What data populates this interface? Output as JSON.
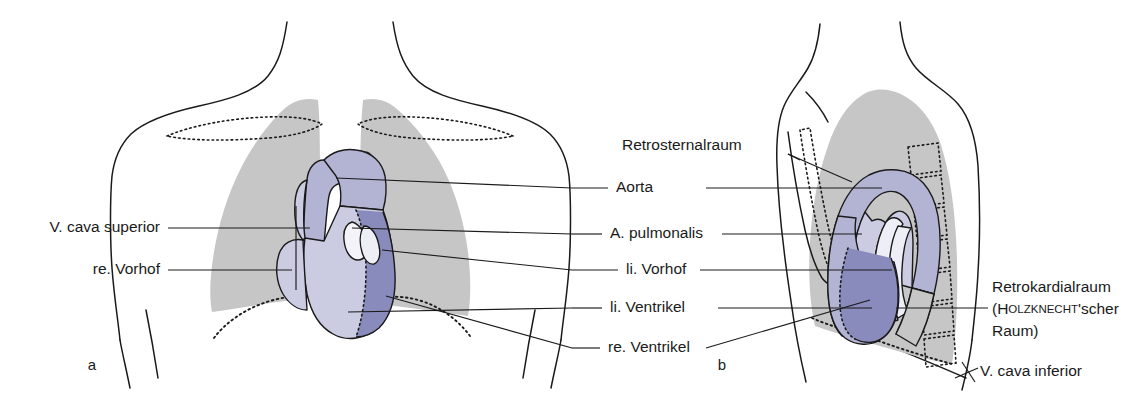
{
  "figure": {
    "panels": [
      {
        "id": "a",
        "letter": "a",
        "view": "frontal (p.-a.) Projektion"
      },
      {
        "id": "b",
        "letter": "b",
        "view": "seitliche Projektion"
      }
    ]
  },
  "labels": {
    "left": [
      {
        "id": "v-cava-superior",
        "text": "V. cava superior"
      },
      {
        "id": "re-vorhof",
        "text": "re. Vorhof"
      }
    ],
    "center": [
      {
        "id": "retrosternalraum",
        "text": "Retrosternalraum"
      },
      {
        "id": "aorta",
        "text": "Aorta"
      },
      {
        "id": "a-pulmonalis",
        "text": "A. pulmonalis"
      },
      {
        "id": "li-vorhof",
        "text": "li. Vorhof"
      },
      {
        "id": "li-ventrikel",
        "text": "li. Ventrikel"
      },
      {
        "id": "re-ventrikel",
        "text": "re. Ventrikel"
      }
    ],
    "right": [
      {
        "id": "retrokardialraum",
        "line1": "Retrokardialraum",
        "line2_pre": "(H",
        "line2_smallcaps": "OLZKNECHT",
        "line2_post": "'scher",
        "line3": "Raum)"
      },
      {
        "id": "v-cava-inferior",
        "text": "V. cava inferior"
      }
    ]
  },
  "colors": {
    "lung_gray": "#c6c6c6",
    "heart_light": "#cbcce2",
    "heart_mid": "#b3b4d4",
    "heart_dark": "#8a8bbd",
    "vessel_white": "#eeeef6",
    "outline": "#1a1a1a",
    "background": "#ffffff"
  }
}
